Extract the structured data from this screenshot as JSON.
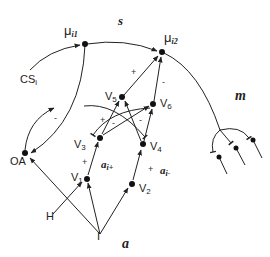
{
  "diagram": {
    "type": "neural circuit diagram",
    "regions": {
      "s": "s",
      "m": "m",
      "a": "a"
    },
    "nodes": {
      "mu1": {
        "main": "μ",
        "sub": "i1"
      },
      "mu2": {
        "main": "μ",
        "sub": "i2"
      },
      "cs": {
        "main": "CS",
        "sub": "i"
      },
      "oa": "OA",
      "v1": {
        "main": "V",
        "sub": "1"
      },
      "v2": {
        "main": "V",
        "sub": "2"
      },
      "v3": {
        "main": "V",
        "sub": "3"
      },
      "v4": {
        "main": "V",
        "sub": "4"
      },
      "v5": {
        "main": "V",
        "sub": "5"
      },
      "v6": {
        "main": "V",
        "sub": "6"
      },
      "h": "H",
      "i": "I"
    },
    "edge_labels": {
      "ai_plus": {
        "main": "a",
        "sub": "i+"
      },
      "ai_minus": {
        "main": "a",
        "sub": "i-"
      },
      "plus_v1_v3": "+",
      "plus_v2_v4": "+",
      "plus_v5_mu2": "+",
      "minus_v6_mu2": "-",
      "minus_oa": "-",
      "plus_v3_v5": "+",
      "minus_v3_v6": "-",
      "minus_v4_v5": "-"
    },
    "edges": [
      "CS_i → μi1",
      "μi1 → μi2",
      "μi1 → OA",
      "OA → μi1 (-)",
      "I → OA",
      "I → V1",
      "I → V2",
      "H → V1",
      "V1 → V3 (+, ai+)",
      "V2 → V4 (+, ai-)",
      "V3 → V5 (+)",
      "V3 → V6",
      "V4 → V5 (-)",
      "V4 → V6",
      "V5 → μi2 (+)",
      "V6 → μi2 (-)",
      "μi2 → motor outputs m (3 branches)"
    ]
  }
}
